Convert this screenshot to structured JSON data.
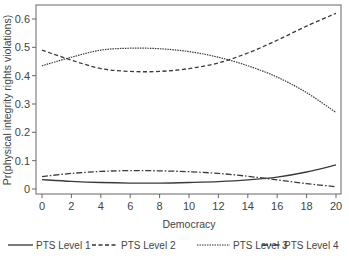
{
  "chart_data": {
    "type": "line",
    "title": "",
    "xlabel": "Democracy",
    "ylabel": "Pr(physical integrity rights violations)",
    "xlim": [
      0,
      20
    ],
    "ylim": [
      0,
      0.6
    ],
    "x_ticks": [
      0,
      2,
      4,
      6,
      8,
      10,
      12,
      14,
      16,
      18,
      20
    ],
    "y_ticks": [
      0,
      0.1,
      0.2,
      0.3,
      0.4,
      0.5,
      0.6
    ],
    "y_tick_labels": [
      "0",
      "0.1",
      "0.2",
      "0.3",
      "0.4",
      "0.5",
      "0.6"
    ],
    "grid": false,
    "legend_position": "bottom",
    "x": [
      0,
      2,
      4,
      6,
      8,
      10,
      12,
      14,
      16,
      18,
      20
    ],
    "series": [
      {
        "name": "PTS Level 1",
        "style": "solid",
        "values": [
          0.033,
          0.027,
          0.023,
          0.021,
          0.021,
          0.023,
          0.026,
          0.032,
          0.042,
          0.06,
          0.085
        ]
      },
      {
        "name": "PTS Level 2",
        "style": "dashed",
        "values": [
          0.49,
          0.455,
          0.425,
          0.415,
          0.415,
          0.425,
          0.445,
          0.48,
          0.525,
          0.575,
          0.62
        ]
      },
      {
        "name": "PTS Level 3",
        "style": "dotted",
        "values": [
          0.435,
          0.465,
          0.49,
          0.497,
          0.495,
          0.485,
          0.465,
          0.435,
          0.395,
          0.34,
          0.27
        ]
      },
      {
        "name": "PTS Level 4",
        "style": "dash-dot",
        "values": [
          0.044,
          0.055,
          0.062,
          0.065,
          0.064,
          0.061,
          0.055,
          0.045,
          0.032,
          0.019,
          0.008
        ]
      }
    ]
  },
  "legend": {
    "items": [
      {
        "label": "PTS Level 1"
      },
      {
        "label": "PTS Level 2"
      },
      {
        "label": "PTS Level 3"
      },
      {
        "label": "PTS Level 4"
      }
    ]
  },
  "axes": {
    "x_title": "Democracy",
    "y_title": "Pr(physical integrity rights violations)"
  },
  "colors": {
    "line": "#3a3a3a",
    "frame": "#555555",
    "text": "#444444"
  }
}
